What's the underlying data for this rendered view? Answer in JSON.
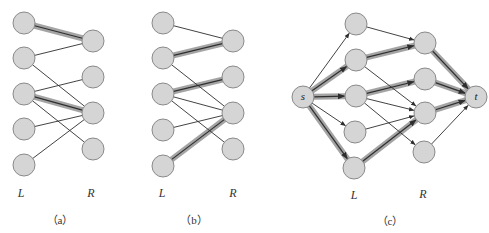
{
  "colors": {
    "node_fill": "#d5d5d5",
    "node_stroke": "#8a8a8a",
    "edge": "#2e2e2e",
    "highlight_halo": "#9a9a9a",
    "background": "#ffffff"
  },
  "node_radius": 11,
  "panels": [
    {
      "id": "a",
      "caption": "（a）",
      "caption_pos": [
        60,
        219
      ],
      "left_label": "L",
      "left_label_pos": [
        21,
        193
      ],
      "right_label": "R",
      "right_label_pos": [
        91,
        193
      ],
      "left_nodes": [
        [
          24,
          23
        ],
        [
          24,
          58
        ],
        [
          24,
          94
        ],
        [
          24,
          129
        ],
        [
          24,
          165
        ]
      ],
      "right_nodes": [
        [
          93,
          41
        ],
        [
          93,
          77
        ],
        [
          93,
          113
        ],
        [
          93,
          149
        ]
      ],
      "edges": [
        {
          "from": [
            "L",
            0
          ],
          "to": [
            "R",
            0
          ],
          "matched": true
        },
        {
          "from": [
            "L",
            1
          ],
          "to": [
            "R",
            0
          ],
          "matched": false
        },
        {
          "from": [
            "L",
            1
          ],
          "to": [
            "R",
            2
          ],
          "matched": false
        },
        {
          "from": [
            "L",
            2
          ],
          "to": [
            "R",
            1
          ],
          "matched": false
        },
        {
          "from": [
            "L",
            2
          ],
          "to": [
            "R",
            2
          ],
          "matched": true
        },
        {
          "from": [
            "L",
            2
          ],
          "to": [
            "R",
            3
          ],
          "matched": false
        },
        {
          "from": [
            "L",
            3
          ],
          "to": [
            "R",
            2
          ],
          "matched": false
        },
        {
          "from": [
            "L",
            4
          ],
          "to": [
            "R",
            2
          ],
          "matched": false
        }
      ]
    },
    {
      "id": "b",
      "caption": "（b）",
      "caption_pos": [
        194,
        219
      ],
      "left_label": "L",
      "left_label_pos": [
        162,
        193
      ],
      "right_label": "R",
      "right_label_pos": [
        233,
        193
      ],
      "left_nodes": [
        [
          163,
          23
        ],
        [
          163,
          58
        ],
        [
          163,
          94
        ],
        [
          163,
          130
        ],
        [
          163,
          166
        ]
      ],
      "right_nodes": [
        [
          233,
          41
        ],
        [
          233,
          77
        ],
        [
          233,
          113
        ],
        [
          233,
          149
        ]
      ],
      "edges": [
        {
          "from": [
            "L",
            0
          ],
          "to": [
            "R",
            0
          ],
          "matched": false
        },
        {
          "from": [
            "L",
            1
          ],
          "to": [
            "R",
            0
          ],
          "matched": true
        },
        {
          "from": [
            "L",
            1
          ],
          "to": [
            "R",
            2
          ],
          "matched": false
        },
        {
          "from": [
            "L",
            2
          ],
          "to": [
            "R",
            1
          ],
          "matched": true
        },
        {
          "from": [
            "L",
            2
          ],
          "to": [
            "R",
            2
          ],
          "matched": false
        },
        {
          "from": [
            "L",
            2
          ],
          "to": [
            "R",
            3
          ],
          "matched": false
        },
        {
          "from": [
            "L",
            3
          ],
          "to": [
            "R",
            2
          ],
          "matched": false
        },
        {
          "from": [
            "L",
            4
          ],
          "to": [
            "R",
            2
          ],
          "matched": true
        }
      ]
    },
    {
      "id": "c",
      "caption": "（c）",
      "caption_pos": [
        390,
        220
      ],
      "left_label": "L",
      "left_label_pos": [
        354,
        195
      ],
      "right_label": "R",
      "right_label_pos": [
        423,
        194
      ],
      "source": {
        "label": "s",
        "pos": [
          303,
          97
        ]
      },
      "sink": {
        "label": "t",
        "pos": [
          476,
          97
        ]
      },
      "left_nodes": [
        [
          356,
          24
        ],
        [
          356,
          60
        ],
        [
          356,
          96
        ],
        [
          355,
          132
        ],
        [
          354,
          168
        ]
      ],
      "right_nodes": [
        [
          425,
          43
        ],
        [
          425,
          79
        ],
        [
          425,
          113
        ],
        [
          424,
          152
        ]
      ],
      "edges": [
        {
          "from": [
            "S",
            0
          ],
          "to": [
            "L",
            0
          ],
          "flow": false
        },
        {
          "from": [
            "S",
            0
          ],
          "to": [
            "L",
            1
          ],
          "flow": true
        },
        {
          "from": [
            "S",
            0
          ],
          "to": [
            "L",
            2
          ],
          "flow": true
        },
        {
          "from": [
            "S",
            0
          ],
          "to": [
            "L",
            3
          ],
          "flow": false
        },
        {
          "from": [
            "S",
            0
          ],
          "to": [
            "L",
            4
          ],
          "flow": true
        },
        {
          "from": [
            "L",
            0
          ],
          "to": [
            "R",
            0
          ],
          "flow": false
        },
        {
          "from": [
            "L",
            1
          ],
          "to": [
            "R",
            0
          ],
          "flow": true
        },
        {
          "from": [
            "L",
            1
          ],
          "to": [
            "R",
            2
          ],
          "flow": false
        },
        {
          "from": [
            "L",
            2
          ],
          "to": [
            "R",
            1
          ],
          "flow": true
        },
        {
          "from": [
            "L",
            2
          ],
          "to": [
            "R",
            2
          ],
          "flow": false
        },
        {
          "from": [
            "L",
            2
          ],
          "to": [
            "R",
            3
          ],
          "flow": false
        },
        {
          "from": [
            "L",
            3
          ],
          "to": [
            "R",
            2
          ],
          "flow": false
        },
        {
          "from": [
            "L",
            4
          ],
          "to": [
            "R",
            2
          ],
          "flow": true
        },
        {
          "from": [
            "R",
            0
          ],
          "to": [
            "T",
            0
          ],
          "flow": true
        },
        {
          "from": [
            "R",
            1
          ],
          "to": [
            "T",
            0
          ],
          "flow": true
        },
        {
          "from": [
            "R",
            2
          ],
          "to": [
            "T",
            0
          ],
          "flow": true
        },
        {
          "from": [
            "R",
            3
          ],
          "to": [
            "T",
            0
          ],
          "flow": false
        }
      ]
    }
  ]
}
